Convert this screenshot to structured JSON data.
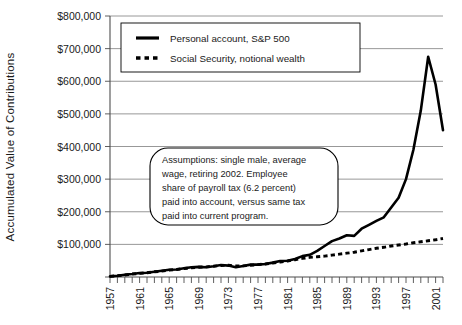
{
  "chart_data": {
    "type": "line",
    "title": "",
    "xlabel": "",
    "ylabel": "Accumulated Value of Contributions",
    "xlim": [
      1957,
      2002
    ],
    "ylim": [
      0,
      800000
    ],
    "grid": true,
    "legend_position": "top-left",
    "y_ticks": [
      0,
      100000,
      200000,
      300000,
      400000,
      500000,
      600000,
      700000,
      800000
    ],
    "y_tick_labels": [
      "",
      "$100,000",
      "$200,000",
      "$300,000",
      "$400,000",
      "$500,000",
      "$600,000",
      "$700,000",
      "$800,000"
    ],
    "x_ticks_all": [
      1957,
      1958,
      1959,
      1960,
      1961,
      1962,
      1963,
      1964,
      1965,
      1966,
      1967,
      1968,
      1969,
      1970,
      1971,
      1972,
      1973,
      1974,
      1975,
      1976,
      1977,
      1978,
      1979,
      1980,
      1981,
      1982,
      1983,
      1984,
      1985,
      1986,
      1987,
      1988,
      1989,
      1990,
      1991,
      1992,
      1993,
      1994,
      1995,
      1996,
      1997,
      1998,
      1999,
      2000,
      2001,
      2002
    ],
    "x_tick_labels": [
      "1957",
      "1961",
      "1965",
      "1969",
      "1973",
      "1977",
      "1981",
      "1985",
      "1989",
      "1993",
      "1997",
      "2001"
    ],
    "x_tick_label_years": [
      1957,
      1961,
      1965,
      1969,
      1973,
      1977,
      1981,
      1985,
      1989,
      1993,
      1997,
      2001
    ],
    "x": [
      1957,
      1958,
      1959,
      1960,
      1961,
      1962,
      1963,
      1964,
      1965,
      1966,
      1967,
      1968,
      1969,
      1970,
      1971,
      1972,
      1973,
      1974,
      1975,
      1976,
      1977,
      1978,
      1979,
      1980,
      1981,
      1982,
      1983,
      1984,
      1985,
      1986,
      1987,
      1988,
      1989,
      1990,
      1991,
      1992,
      1993,
      1994,
      1995,
      1996,
      1997,
      1998,
      1999,
      2000,
      2001,
      2002
    ],
    "series": [
      {
        "name": "Personal account, S&P 500",
        "style": "solid",
        "color": "#000000",
        "values": [
          2000,
          4000,
          7000,
          9000,
          12000,
          13000,
          16000,
          19000,
          22000,
          23000,
          27000,
          30000,
          31000,
          30000,
          33000,
          37000,
          35000,
          30000,
          34000,
          38000,
          38000,
          40000,
          44000,
          49000,
          50000,
          55000,
          64000,
          68000,
          80000,
          95000,
          110000,
          118000,
          128000,
          126000,
          148000,
          160000,
          172000,
          183000,
          213000,
          243000,
          300000,
          390000,
          510000,
          675000,
          590000,
          450000
        ]
      },
      {
        "name": "Social Security, notional wealth",
        "style": "dashed",
        "color": "#000000",
        "values": [
          2000,
          4000,
          6000,
          9000,
          11000,
          13000,
          16000,
          18000,
          21000,
          23000,
          26000,
          28000,
          30000,
          31000,
          33000,
          35000,
          36000,
          34000,
          34000,
          36000,
          38000,
          40000,
          43000,
          46000,
          49000,
          53000,
          57000,
          60000,
          62000,
          64000,
          67000,
          70000,
          73000,
          76000,
          80000,
          84000,
          88000,
          91000,
          95000,
          98000,
          101000,
          105000,
          108000,
          111000,
          114000,
          118000
        ]
      }
    ],
    "annotations": [
      {
        "name": "assumptions-note",
        "lines": [
          "Assumptions: single male, average",
          "wage, retiring 2002. Employee",
          "share of payroll tax (6.2 percent)",
          "paid into account, versus same tax",
          "paid into current program."
        ]
      }
    ]
  }
}
